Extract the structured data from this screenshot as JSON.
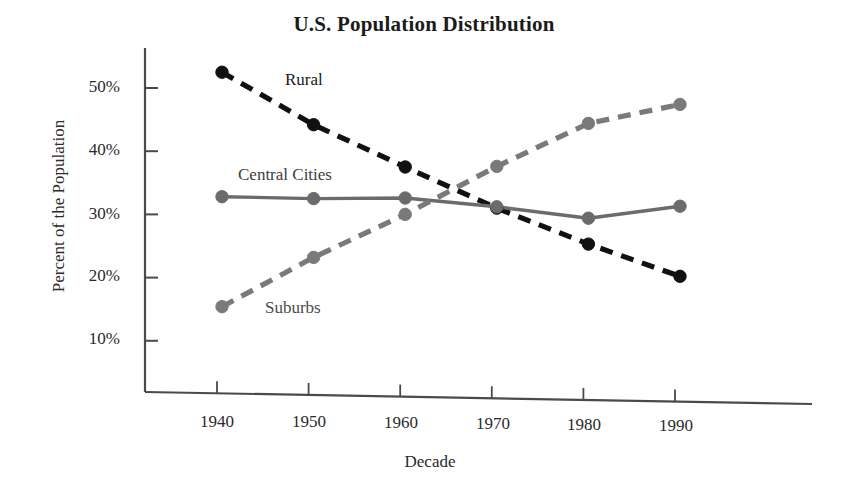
{
  "chart_data": {
    "type": "line",
    "title": "U.S. Population Distribution",
    "xlabel": "Decade",
    "ylabel": "Percent of the Population",
    "categories": [
      "1940",
      "1950",
      "1960",
      "1970",
      "1980",
      "1990"
    ],
    "x": [
      1940,
      1950,
      1960,
      1970,
      1980,
      1990
    ],
    "xlim": [
      1935,
      1995
    ],
    "ylim": [
      5,
      55
    ],
    "ytick_labels": [
      "10%",
      "20%",
      "30%",
      "40%",
      "50%"
    ],
    "ytick_values": [
      10,
      20,
      30,
      40,
      50
    ],
    "grid": false,
    "legend": "inline-labels",
    "series": [
      {
        "name": "Rural",
        "values": [
          52.5,
          44.2,
          37.5,
          31.0,
          25.3,
          20.2
        ],
        "color": "#111111",
        "style": "dashed",
        "marker": "circle"
      },
      {
        "name": "Central Cities",
        "values": [
          32.8,
          32.5,
          32.6,
          31.2,
          29.4,
          31.3
        ],
        "color": "#6b6b6b",
        "style": "solid",
        "marker": "circle"
      },
      {
        "name": "Suburbs",
        "values": [
          15.4,
          23.2,
          30.0,
          37.6,
          44.4,
          47.4
        ],
        "color": "#7a7a7a",
        "style": "dashed",
        "marker": "circle"
      }
    ],
    "annotations": [
      {
        "text": "Rural",
        "x": 1944.2,
        "y": 48.5
      },
      {
        "text": "Central Cities",
        "x": 1941.5,
        "y": 35.0
      },
      {
        "text": "Suburbs",
        "x": 1943.0,
        "y": 16.8
      }
    ]
  },
  "axes": {
    "y_ticks": [
      {
        "label": "50%"
      },
      {
        "label": "40%"
      },
      {
        "label": "30%"
      },
      {
        "label": "20%"
      },
      {
        "label": "10%"
      }
    ],
    "x_ticks": [
      {
        "label": "1940"
      },
      {
        "label": "1950"
      },
      {
        "label": "1960"
      },
      {
        "label": "1970"
      },
      {
        "label": "1980"
      },
      {
        "label": "1990"
      }
    ]
  },
  "colors": {
    "background": "#ffffff",
    "axis": "#4a4a4a",
    "rural": "#111111",
    "central_cities": "#6b6b6b",
    "suburbs": "#7a7a7a"
  }
}
